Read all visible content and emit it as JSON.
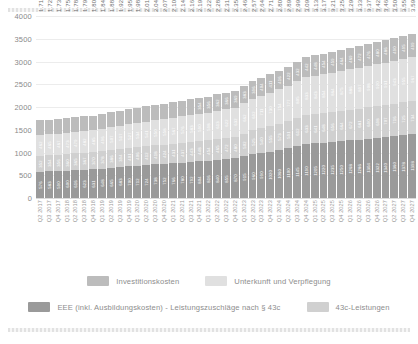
{
  "chart_data": {
    "type": "bar",
    "stacked": true,
    "title": "",
    "xlabel": "",
    "ylabel": "",
    "ylim": [
      0,
      4000
    ],
    "yticks": [
      "4000",
      "3500",
      "3000",
      "2500",
      "2000",
      "1500",
      "1000",
      "500",
      "0"
    ],
    "grid": true,
    "legend_position": "bottom",
    "categories": [
      "Q2 2017",
      "Q3 2017",
      "Q4 2017",
      "Q1 2018",
      "Q2 2018",
      "Q3 2018",
      "Q4 2018",
      "Q1 2019",
      "Q2 2019",
      "Q3 2019",
      "Q4 2019",
      "Q1 2020",
      "Q2 2020",
      "Q3 2020",
      "Q4 2020",
      "Q1 2021",
      "Q2 2021",
      "Q3 2021",
      "Q4 2021",
      "Q1 2022",
      "Q2 2022",
      "Q3 2022",
      "Q4 2022",
      "Q1 2023",
      "Q2 2023",
      "Q3 2023",
      "Q4 2023",
      "Q1 2024",
      "Q2 2024",
      "Q3 2024",
      "Q4 2024",
      "Q1 2025",
      "Q2 2025",
      "Q3 2025",
      "Q4 2025",
      "Q1 2026",
      "Q2 2026",
      "Q3 2026",
      "Q4 2026",
      "Q1 2027",
      "Q2 2027",
      "Q3 2027",
      "Q4 2027"
    ],
    "totals": [
      "1.716",
      "1.726",
      "1.736",
      "1.759",
      "1.782",
      "1.793",
      "1.804",
      "1.844",
      "1.884",
      "1.922",
      "1.959",
      "1.986",
      "2.013",
      "2.045",
      "2.076",
      "2.109",
      "2.141",
      "2.169",
      "2.196",
      "2.224",
      "2.280",
      "2.315",
      "2.351",
      "2.462",
      "2.573",
      "2.645",
      "2.716",
      "2.803",
      "2.890",
      "2.994",
      "3.098",
      "3.137",
      "3.176",
      "3.214",
      "3.253",
      "3.295",
      "3.336",
      "3.378",
      "3.420",
      "3.464",
      "3.509",
      "3.553",
      "3.598"
    ],
    "series": [
      {
        "name": "EEE (inkl. Ausbildungskosten) - Leistungszuschläge nach § 43c",
        "color": "#9a9a9a",
        "values": [
          576,
          583,
          590,
          600,
          616,
          623,
          631,
          648,
          665,
          683,
          700,
          712,
          724,
          738,
          752,
          766,
          780,
          792,
          804,
          816,
          840,
          855,
          870,
          915,
          960,
          990,
          1020,
          1060,
          1100,
          1145,
          1190,
          1205,
          1220,
          1235,
          1250,
          1268,
          1286,
          1304,
          1322,
          1340,
          1360,
          1378,
          1398
        ]
      },
      {
        "name": "43c-Leistungen",
        "color": "#d0d0d0",
        "values": [
          352,
          354,
          356,
          360,
          365,
          367,
          370,
          378,
          386,
          394,
          401,
          406,
          412,
          418,
          424,
          431,
          437,
          443,
          448,
          454,
          465,
          472,
          480,
          502,
          525,
          540,
          555,
          573,
          591,
          612,
          633,
          641,
          648,
          656,
          664,
          672,
          681,
          690,
          698,
          707,
          716,
          725,
          734
        ]
      },
      {
        "name": "Unterkunft und Verpflegung",
        "color": "#e0e0e0",
        "values": [
          462,
          465,
          467,
          473,
          479,
          482,
          485,
          496,
          507,
          517,
          527,
          534,
          541,
          550,
          558,
          567,
          576,
          583,
          590,
          598,
          613,
          622,
          632,
          662,
          692,
          711,
          730,
          754,
          777,
          805,
          833,
          843,
          854,
          864,
          875,
          886,
          897,
          908,
          920,
          931,
          943,
          955,
          967
        ]
      },
      {
        "name": "Investitionskosten",
        "color": "#bcbcbc",
        "values": [
          326,
          324,
          323,
          326,
          322,
          321,
          318,
          322,
          326,
          328,
          331,
          334,
          336,
          339,
          342,
          345,
          348,
          351,
          354,
          356,
          362,
          366,
          369,
          383,
          396,
          404,
          411,
          416,
          422,
          432,
          442,
          448,
          454,
          459,
          464,
          469,
          472,
          476,
          480,
          486,
          490,
          495,
          499
        ]
      }
    ],
    "legend": [
      {
        "label": "Investitionskosten",
        "color": "#bcbcbc"
      },
      {
        "label": "Unterkunft und Verpflegung",
        "color": "#e0e0e0"
      },
      {
        "label": "EEE (inkl. Ausbildungskosten) - Leistungszuschläge nach § 43c",
        "color": "#9a9a9a"
      },
      {
        "label": "43c-Leistungen",
        "color": "#d0d0d0"
      }
    ]
  }
}
